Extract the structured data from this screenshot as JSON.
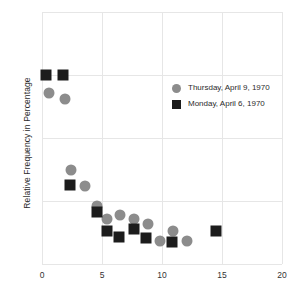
{
  "chart_data": {
    "type": "scatter",
    "title": "",
    "xlabel": "",
    "ylabel": "Relative Frequency in Percentage",
    "xlim": [
      0,
      20
    ],
    "ylim": [
      0,
      4
    ],
    "xticks": [
      "0",
      "5",
      "10",
      "15",
      "20"
    ],
    "xtick_values": [
      0,
      5,
      10,
      15,
      20
    ],
    "yticks": [],
    "grid": true,
    "legend_position": "upper-right-inside",
    "series": [
      {
        "name": "Thursday, April 9, 1970",
        "marker": "circle",
        "color": "#8c8c8c",
        "points": [
          {
            "x": 0.6,
            "y": 2.72
          },
          {
            "x": 1.9,
            "y": 2.62
          },
          {
            "x": 2.4,
            "y": 1.49
          },
          {
            "x": 3.6,
            "y": 1.24
          },
          {
            "x": 4.6,
            "y": 0.92
          },
          {
            "x": 5.4,
            "y": 0.71
          },
          {
            "x": 6.5,
            "y": 0.78
          },
          {
            "x": 7.7,
            "y": 0.72
          },
          {
            "x": 8.8,
            "y": 0.63
          },
          {
            "x": 9.8,
            "y": 0.36
          },
          {
            "x": 10.9,
            "y": 0.52
          },
          {
            "x": 12.1,
            "y": 0.36
          }
        ]
      },
      {
        "name": "Monday, April 6, 1970",
        "marker": "square",
        "color": "#1c1c1c",
        "points": [
          {
            "x": 0.35,
            "y": 3.0
          },
          {
            "x": 1.75,
            "y": 3.0
          },
          {
            "x": 2.35,
            "y": 1.25
          },
          {
            "x": 4.6,
            "y": 0.82
          },
          {
            "x": 5.4,
            "y": 0.52
          },
          {
            "x": 6.4,
            "y": 0.43
          },
          {
            "x": 7.7,
            "y": 0.55
          },
          {
            "x": 8.7,
            "y": 0.42
          },
          {
            "x": 10.8,
            "y": 0.35
          },
          {
            "x": 14.5,
            "y": 0.52
          }
        ]
      }
    ]
  },
  "legend": {
    "items": [
      {
        "label": "Thursday, April 9, 1970",
        "marker": "circle"
      },
      {
        "label": "Monday, April 6, 1970",
        "marker": "square"
      }
    ]
  },
  "axes": {
    "ylabel": "Relative Frequency in Percentage",
    "xticks": [
      "0",
      "5",
      "10",
      "15",
      "20"
    ]
  },
  "colors": {
    "circle": "#8c8c8c",
    "square": "#1c1c1c",
    "grid": "#e6e6e6",
    "axis": "#cfcfcf",
    "text": "#2b2b2b",
    "background": "#ffffff"
  }
}
